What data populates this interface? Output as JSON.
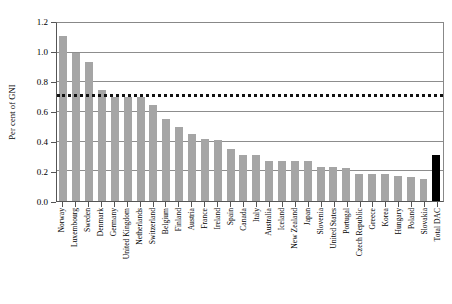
{
  "chart_data": {
    "type": "bar",
    "title": "",
    "xlabel": "",
    "ylabel": "Per cent of GNI",
    "ylim": [
      0.0,
      1.2
    ],
    "yticks": [
      "0.0",
      "0.2",
      "0.4",
      "0.6",
      "0.8",
      "1.0",
      "1.2"
    ],
    "ytick_values": [
      0.0,
      0.2,
      0.4,
      0.6,
      0.8,
      1.0,
      1.2
    ],
    "grid": true,
    "legend": "none",
    "reference_line": {
      "value": 0.7,
      "style": "dotted",
      "color": "#111111"
    },
    "bar_color": "#a5a5a5",
    "highlight_color": "#000000",
    "categories": [
      "Norway",
      "Luxembourg",
      "Sweden",
      "Denmark",
      "Germany",
      "United Kingdom",
      "Netherlands",
      "Switzerland",
      "Belgium",
      "Finland",
      "Austria",
      "France",
      "Ireland",
      "Spain",
      "Canada",
      "Italy",
      "Australia",
      "Iceland",
      "New Zealand",
      "Japan",
      "Slovenia",
      "United States",
      "Portugal",
      "Czech Republic",
      "Greece",
      "Korea",
      "Hungary",
      "Poland",
      "Slovakia",
      "Total DAC"
    ],
    "values": [
      1.11,
      1.0,
      0.94,
      0.75,
      0.7,
      0.7,
      0.7,
      0.65,
      0.55,
      0.5,
      0.45,
      0.42,
      0.41,
      0.35,
      0.31,
      0.31,
      0.27,
      0.27,
      0.27,
      0.27,
      0.23,
      0.23,
      0.22,
      0.18,
      0.18,
      0.18,
      0.17,
      0.16,
      0.15,
      0.31
    ],
    "highlight_index": 29
  }
}
